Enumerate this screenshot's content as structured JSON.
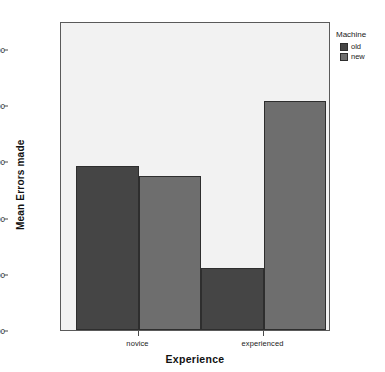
{
  "chart_data": {
    "type": "bar",
    "title": "",
    "subtitle": "",
    "xlabel": "Experience",
    "ylabel": "Mean Errors made",
    "categories": [
      "novice",
      "experienced"
    ],
    "series": [
      {
        "name": "old",
        "values": [
          5.85,
          2.2
        ],
        "color": "#454545"
      },
      {
        "name": "new",
        "values": [
          5.5,
          8.15
        ],
        "color": "#6e6e6e"
      }
    ],
    "ylim": [
      0,
      11.0
    ],
    "yticks": [
      0,
      2,
      4,
      6,
      8,
      10
    ],
    "ytick_labels": [
      "0.00",
      "2.00",
      "4.00",
      "6.00",
      "8.00",
      "10.00"
    ],
    "grid": false,
    "legend": {
      "title": "Machine",
      "position": "right-top"
    },
    "plot_background": "#f2f2f2",
    "frame_color": "#5a5a5a"
  },
  "legend": {
    "title": "Machine",
    "items": [
      {
        "label": "old",
        "color": "#454545"
      },
      {
        "label": "new",
        "color": "#6e6e6e"
      }
    ]
  },
  "axes": {
    "y_title": "Mean Errors made",
    "x_title": "Experience",
    "y_tick_labels": [
      "10.00",
      "8.00",
      "6.00",
      "4.00",
      "2.00",
      "0.00"
    ],
    "x_tick_labels": [
      "novice",
      "experienced"
    ]
  }
}
